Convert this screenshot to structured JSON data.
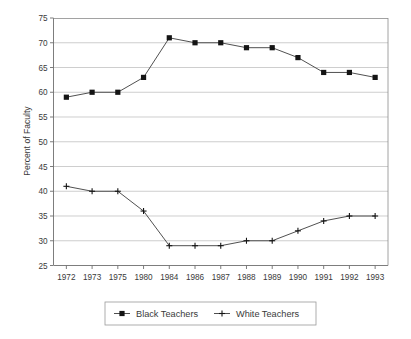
{
  "chart_data": {
    "type": "line",
    "title": "",
    "xlabel": "",
    "ylabel": "Percent of Faculty",
    "categories": [
      "1972",
      "1973",
      "1975",
      "1980",
      "1984",
      "1986",
      "1987",
      "1988",
      "1989",
      "1990",
      "1991",
      "1992",
      "1993"
    ],
    "ylim": [
      25,
      75
    ],
    "ytick_step": 5,
    "yticks": [
      25,
      30,
      35,
      40,
      45,
      50,
      55,
      60,
      65,
      70,
      75
    ],
    "grid": true,
    "legend_position": "bottom-center",
    "series": [
      {
        "name": "Black Teachers",
        "marker": "filled-square",
        "color": "#141414",
        "values": [
          59,
          60,
          60,
          63,
          71,
          70,
          70,
          69,
          69,
          67,
          64,
          64,
          63
        ]
      },
      {
        "name": "White Teachers",
        "marker": "plus",
        "color": "#141414",
        "values": [
          41,
          40,
          40,
          36,
          29,
          29,
          29,
          30,
          30,
          32,
          34,
          35,
          35
        ]
      }
    ]
  },
  "legend": {
    "entries": [
      {
        "label": "Black Teachers"
      },
      {
        "label": "White Teachers"
      }
    ]
  },
  "axes": {
    "y_title": "Percent of Faculty"
  }
}
